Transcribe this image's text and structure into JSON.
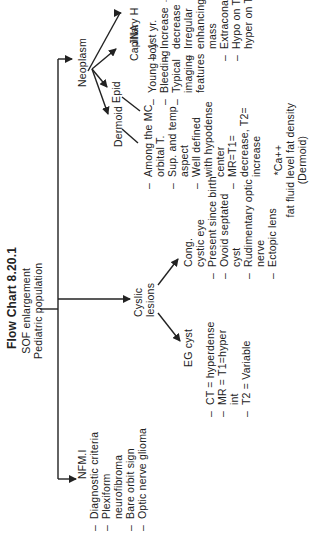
{
  "title": "Flow Chart 8.20.1",
  "root": {
    "line1": "SOF enlargement",
    "line2": "Pediatric population"
  },
  "nf": {
    "label": "NFM.I",
    "items": [
      {
        "text": "Diagnostic criteria",
        "dash": true
      },
      {
        "text": "Plexiform",
        "dash": true
      },
      {
        "text": "neurofibroma",
        "dash": false
      },
      {
        "text": "Bare orbit sign",
        "dash": true
      },
      {
        "text": "Optic nerve glioma",
        "dash": true
      }
    ]
  },
  "cystic": {
    "label1": "Cyslic",
    "label2": "lesions",
    "eg": {
      "label": "EG cyst",
      "items": [
        {
          "text": "CT = hyperdense",
          "dash": true
        },
        {
          "text": "MR = T1=hyper",
          "dash": true
        },
        {
          "text": "int",
          "dash": false
        },
        {
          "text": "T2 = Variable",
          "dash": true
        }
      ]
    },
    "cong": {
      "label1": "Cong.",
      "label2": "cystic eye",
      "items": [
        {
          "text": "Present since birth",
          "dash": true
        },
        {
          "text": "Ovoid septated",
          "dash": true
        },
        {
          "text": "cyst",
          "dash": false
        },
        {
          "text": "Rudimentary optic",
          "dash": true
        },
        {
          "text": "nerve",
          "dash": false
        },
        {
          "text": "Ectopic lens",
          "dash": true
        }
      ]
    }
  },
  "neoplasm": {
    "label": "Neoplasm",
    "dermoid": {
      "label": "Dermoid",
      "items": [
        {
          "text": "Among the MC",
          "dash": true
        },
        {
          "text": "orbital T.",
          "dash": false
        },
        {
          "text": "Sup. and temp",
          "dash": true
        },
        {
          "text": "aspect",
          "dash": false
        },
        {
          "text": "Well defined",
          "dash": true
        },
        {
          "text": "with hypodense",
          "dash": false
        },
        {
          "text": "center",
          "dash": false
        },
        {
          "text": "MR=T1=",
          "dash": true
        },
        {
          "text": "decrease, T2=",
          "dash": false
        },
        {
          "text": "increase",
          "dash": false
        }
      ],
      "note1": "*Ca++",
      "note2": "fat fluid level fat density",
      "note3": "(Dermoid)"
    },
    "epid": {
      "label": "Epid"
    },
    "jna": {
      "label": "JNA",
      "items": [
        {
          "text": "Young boy",
          "dash": true
        },
        {
          "text": "Bleeding",
          "dash": true
        },
        {
          "text": "Typical",
          "dash": true
        },
        {
          "text": "imaging",
          "dash": false
        },
        {
          "text": "features",
          "dash": false
        }
      ]
    },
    "capillary": {
      "label": "Capillary H",
      "items": [
        {
          "text": "1st yr.",
          "dash": true
        },
        {
          "text": "Increase →",
          "dash": true
        },
        {
          "text": "decrease",
          "dash": false
        },
        {
          "text": "Irregular",
          "dash": true
        },
        {
          "text": "enhancing",
          "dash": false
        },
        {
          "text": "mass",
          "dash": false
        },
        {
          "text": "Extraconal",
          "dash": true
        },
        {
          "text": "Hypo on T1",
          "dash": true
        },
        {
          "text": "hyper on T2",
          "dash": false
        }
      ]
    }
  }
}
